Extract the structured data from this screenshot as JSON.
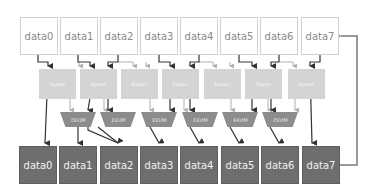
{
  "diagram": {
    "top_row": [
      "data0",
      "data1",
      "data2",
      "data3",
      "data4",
      "data5",
      "data6",
      "data7"
    ],
    "swaps": [
      "swap0",
      "swap1",
      "swap2",
      "swap3",
      "swap4",
      "swap5",
      "swap6"
    ],
    "muxes": [
      "MUX0",
      "MUX1",
      "MUX2",
      "MUX3",
      "MUX4",
      "MUX5"
    ],
    "bottom_row": [
      "data0",
      "data1",
      "data2",
      "data3",
      "data4",
      "data5",
      "data6",
      "data7"
    ],
    "colors": {
      "top_fill": "#ffffff",
      "top_border": "#cfcfcf",
      "swap_fill": "#d4d4d4",
      "mux_fill": "#8c8c8c",
      "bottom_fill": "#6e6e6e",
      "arrow_dark": "#333333",
      "arrow_light": "#b0b0b0",
      "feedback": "#9a9a9a"
    }
  }
}
